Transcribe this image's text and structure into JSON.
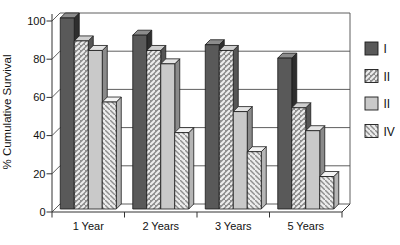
{
  "figure": {
    "background": "#ffffff"
  },
  "chart_data": {
    "type": "bar",
    "projection": "3d",
    "title": "",
    "xlabel": "",
    "ylabel": "% Cumulative Survival",
    "categories": [
      "1 Year",
      "2 Years",
      "3 Years",
      "5 Years"
    ],
    "series": [
      {
        "name": "I",
        "values": [
          100,
          91,
          86,
          79
        ],
        "pattern": "solid",
        "fill": "#595959",
        "top": "#8c8c8c",
        "side": "#2e2e2e"
      },
      {
        "name": "II",
        "values": [
          88,
          83,
          83,
          53
        ],
        "pattern": "diagonal-up",
        "fill": "#8f8f8f",
        "stripe": "#ededed",
        "stripe_width": 2,
        "top": "#cfcfcf",
        "side": "#565656"
      },
      {
        "name": "II",
        "values": [
          83,
          76,
          51,
          41
        ],
        "pattern": "solid",
        "fill": "#c9c9c9",
        "top": "#e4e4e4",
        "side": "#8a8a8a"
      },
      {
        "name": "IV",
        "values": [
          56,
          40,
          30,
          17
        ],
        "pattern": "diagonal-down",
        "fill": "#ececec",
        "stripe": "#8f8f8f",
        "stripe_width": 1.4,
        "top": "#f4f4f4",
        "side": "#b5b5b5"
      }
    ],
    "ylim": [
      0,
      100
    ],
    "yticks": [
      0,
      20,
      40,
      60,
      80,
      100
    ],
    "grid": true,
    "legend_position": "right",
    "axis_color": "#333333",
    "grid_color": "#4d4d4d",
    "outline_color": "#1a1a1a",
    "text_color": "#111111"
  }
}
